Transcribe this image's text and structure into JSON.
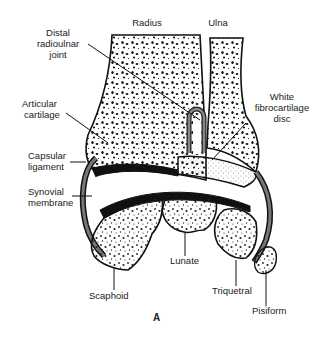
{
  "diagram": {
    "figure_label": "A",
    "colors": {
      "bone_fill": "#ffffff",
      "outline": "#111111",
      "capsule": "#555555",
      "cartilage": "#111111",
      "stipple": "#222222"
    },
    "labels": {
      "radius": "Radius",
      "ulna": "Ulna",
      "distal_radioulnar_joint_1": "Distal",
      "distal_radioulnar_joint_2": "radioulnar",
      "distal_radioulnar_joint_3": "joint",
      "articular_cartilage_1": "Articular",
      "articular_cartilage_2": "cartilage",
      "white_fibrocartilage_disc_1": "White",
      "white_fibrocartilage_disc_2": "fibrocartilage",
      "white_fibrocartilage_disc_3": "disc",
      "capsular_ligament_1": "Capsular",
      "capsular_ligament_2": "ligament",
      "synovial_membrane_1": "Synovial",
      "synovial_membrane_2": "membrane",
      "scaphoid": "Scaphoid",
      "lunate": "Lunate",
      "triquetral": "Triquetral",
      "pisiform": "Pisiform"
    }
  }
}
